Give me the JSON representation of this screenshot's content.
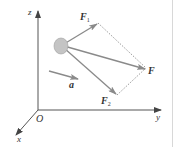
{
  "diagram": {
    "colors": {
      "axis": "#555555",
      "force_arrow": "#8a8a8a",
      "body_fill": "#c4c4c4",
      "body_stroke": "#999999",
      "dotted": "#9a9a9a",
      "label": "#333333",
      "border": "#d8d8d8"
    },
    "axes": {
      "origin_label": "O",
      "x_label": "x",
      "y_label": "y",
      "z_label": "z"
    },
    "vectors": {
      "F1": {
        "main": "F",
        "sub": "1"
      },
      "F2": {
        "main": "F",
        "sub": "2"
      },
      "F": {
        "main": "F"
      },
      "a": {
        "main": "a"
      }
    }
  }
}
